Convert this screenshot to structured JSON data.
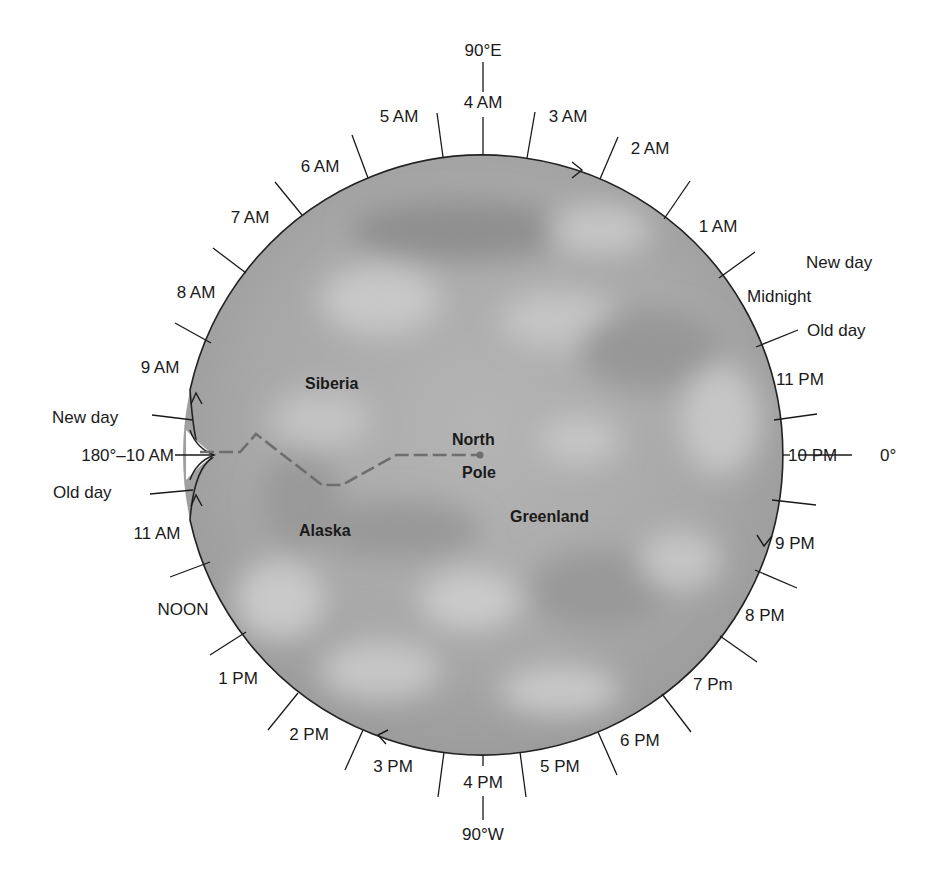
{
  "diagram": {
    "colors": {
      "globe_fill": "#a9a9a9",
      "globe_stroke": "#222222",
      "dateline": "#6e6e6e",
      "text": "#1a1a1a"
    },
    "top_meridian": "90°E",
    "bottom_meridian": "90°W",
    "right_meridian": "0°",
    "left_meridian_prefix": "180°",
    "hours": {
      "h4am": "4 AM",
      "h3am": "3 AM",
      "h2am": "2 AM",
      "h1am": "1 AM",
      "midnight": "Midnight",
      "h11pm": "11 PM",
      "h10pm": "10 PM",
      "h9pm": "9 PM",
      "h8pm": "8 PM",
      "h7pm": "7 Pm",
      "h6pm": "6 PM",
      "h5pm": "5 PM",
      "h4pm": "4 PM",
      "h3pm": "3 PM",
      "h2pm": "2 PM",
      "h1pm": "1 PM",
      "noon": "NOON",
      "h11am": "11 AM",
      "h10am": "10 AM",
      "h9am": "9 AM",
      "h8am": "8 AM",
      "h7am": "7 AM",
      "h6am": "6 AM",
      "h5am": "5 AM"
    },
    "left_label": "180°–10 AM",
    "right_label": "10 PM",
    "dateline_labels": {
      "left_new_day": "New day",
      "left_old_day": "Old day",
      "right_new_day": "New day",
      "right_old_day": "Old day"
    },
    "regions": {
      "siberia": "Siberia",
      "alaska": "Alaska",
      "greenland": "Greenland",
      "north_pole_line1": "North",
      "north_pole_line2": "Pole"
    }
  }
}
